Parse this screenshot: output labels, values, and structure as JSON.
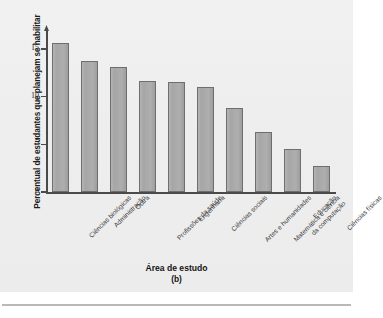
{
  "figure": {
    "panel_letter": "(b)",
    "bar_color": "#a8a8a8",
    "bar_border_color": "#6e6e6e",
    "axis_color": "#4a4a4a",
    "background_color": "#eeeeee"
  },
  "chart_data": {
    "type": "bar",
    "title": "",
    "xlabel": "Área de estudo",
    "ylabel": "Percentual de estudantes que planejam se habilitar",
    "ylim": [
      0,
      17
    ],
    "yticks": [
      0,
      5,
      10,
      15
    ],
    "ytick_labels": [
      "0",
      "5",
      "10",
      "15"
    ],
    "grid": false,
    "legend": false,
    "categories": [
      "Ciências biológicas",
      "Administração",
      "Outra",
      "Profissões da saúde",
      "Engenharia",
      "Ciências sociais",
      "Artes e humanidades",
      "Matemática e ciência\nda computação",
      "Educação",
      "Ciências físicas"
    ],
    "values": [
      15.6,
      13.8,
      13.1,
      11.7,
      11.5,
      11.0,
      8.8,
      6.3,
      4.5,
      2.7
    ]
  }
}
